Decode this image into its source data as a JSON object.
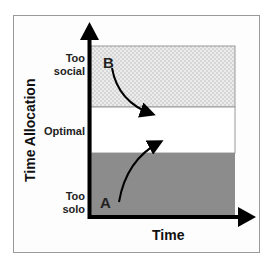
{
  "diagram": {
    "y_axis_label": "Time Allocation",
    "x_axis_label": "Time",
    "zones": [
      {
        "id": "too-social",
        "label_line1": "Too",
        "label_line2": "social",
        "fill": "#e4e4e4",
        "pattern": "checker"
      },
      {
        "id": "optimal",
        "label": "Optimal",
        "fill": "#ffffff"
      },
      {
        "id": "too-solo",
        "label_line1": "Too",
        "label_line2": "solo",
        "fill": "#8c8c8c"
      }
    ],
    "points": [
      {
        "id": "A",
        "label": "A",
        "zone": "too-solo",
        "arrow_direction": "up-right into optimal"
      },
      {
        "id": "B",
        "label": "B",
        "zone": "too-social",
        "arrow_direction": "down-right into optimal"
      }
    ],
    "colors": {
      "axis": "#000000",
      "frame": "#9a9a9a",
      "text": "#222222"
    }
  }
}
